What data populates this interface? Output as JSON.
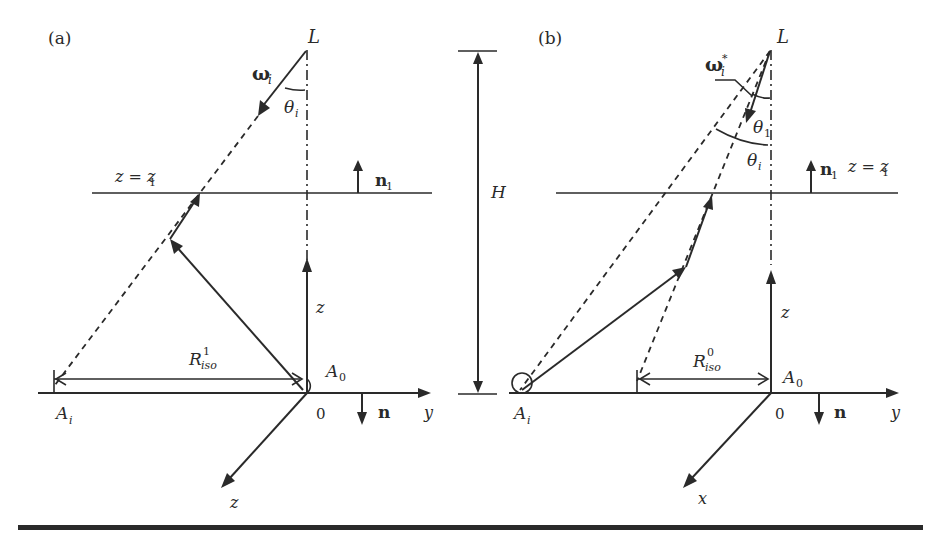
{
  "figure": {
    "panel_a": {
      "tag": "(a)",
      "source_label": "L",
      "direction_label": "ω",
      "direction_sub": "i",
      "angle_label": "θ",
      "angle_sub": "i",
      "plane_label": "z = z",
      "plane_sub": "1",
      "plane_normal": "n",
      "plane_normal_sub": "1",
      "radius_label": "R",
      "radius_sup": "1",
      "radius_sub": "iso",
      "origin_point": "A",
      "origin_point_sub": "0",
      "target_point": "A",
      "target_point_sub": "i",
      "origin": "0",
      "ground_normal": "n",
      "axis_y": "y",
      "axis_z_up": "z",
      "axis_z_diag": "z"
    },
    "height_marker": {
      "label": "H"
    },
    "panel_b": {
      "tag": "(b)",
      "source_label": "L",
      "direction_label": "ω",
      "direction_sub": "i",
      "direction_sup": "*",
      "angle1_label": "θ",
      "angle1_sub": "1",
      "angle2_label": "θ",
      "angle2_sub": "i",
      "plane_label": "z = z",
      "plane_sub": "1",
      "plane_normal": "n",
      "plane_normal_sub": "1",
      "radius_label": "R",
      "radius_sup": "0",
      "radius_sub": "iso",
      "origin_point": "A",
      "origin_point_sub": "0",
      "target_point": "A",
      "target_point_sub": "i",
      "origin": "0",
      "ground_normal": "n",
      "axis_y": "y",
      "axis_z_up": "z",
      "axis_x_diag": "x"
    }
  }
}
